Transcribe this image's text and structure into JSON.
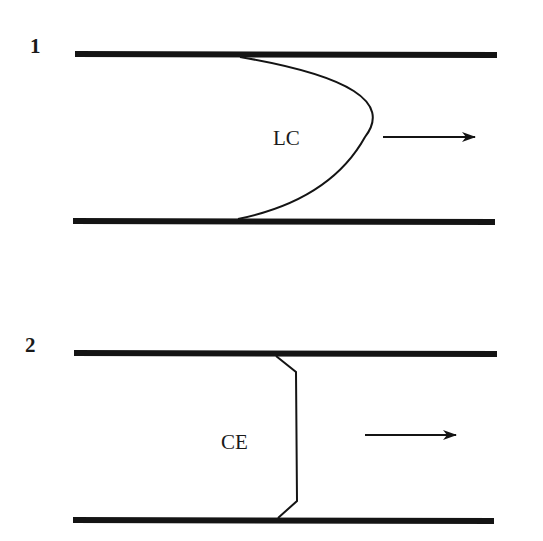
{
  "diagram": {
    "panels": [
      {
        "id": "1",
        "number_label": "1",
        "region_label": "LC",
        "front_shape": "curved (parabolic) front",
        "flow_direction": "right"
      },
      {
        "id": "2",
        "number_label": "2",
        "region_label": "CE",
        "front_shape": "flat front with chamfered corners",
        "flow_direction": "right"
      }
    ],
    "colors": {
      "stroke": "#141414",
      "background": "#ffffff"
    }
  }
}
